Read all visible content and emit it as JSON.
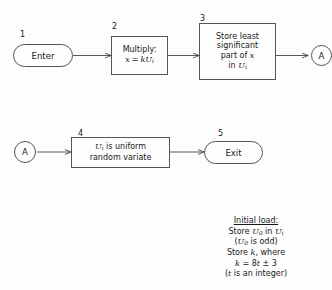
{
  "diagram": {
    "type": "flowchart",
    "title_note": "Initial load",
    "nodes": [
      {
        "id": "n1",
        "step": "1",
        "shape": "terminal",
        "label": "Enter"
      },
      {
        "id": "n2",
        "step": "2",
        "shape": "process",
        "line1": "Multiply:",
        "line2_lhs": "x",
        "line2_eq": "=",
        "line2_rhs_k": "k",
        "line2_rhs_u": "U",
        "line2_rhs_sub": "i"
      },
      {
        "id": "n3",
        "step": "3",
        "shape": "process",
        "line1": "Store least",
        "line2": "significant",
        "line3a": "part of",
        "line3b": "x",
        "line4a": "in",
        "line4b": "U",
        "line4sub": "i"
      },
      {
        "id": "cA_right",
        "shape": "connector",
        "label": "A"
      },
      {
        "id": "cA_left",
        "shape": "connector",
        "label": "A"
      },
      {
        "id": "n4",
        "step": "4",
        "shape": "process",
        "line1a": "U",
        "line1sub": "i",
        "line1b": "is uniform",
        "line2": "random variate"
      },
      {
        "id": "n5",
        "step": "5",
        "shape": "terminal",
        "label": "Exit"
      }
    ],
    "note": {
      "title": "Initial load:",
      "l1_a": "Store",
      "l1_u0": "U",
      "l1_u0sub": "0",
      "l1_b": "in",
      "l1_ui": "U",
      "l1_uisub": "i",
      "l2_open": "(",
      "l2_u0": "U",
      "l2_u0sub": "0",
      "l2_rest": "is odd)",
      "l3_a": "Store",
      "l3_k": "k",
      "l3_b": ", where",
      "l4_k": "k",
      "l4_eq": "= 8",
      "l4_t": "t",
      "l4_pm": "± 3",
      "l5_open": "(",
      "l5_t": "t",
      "l5_rest": "is an integer)"
    },
    "colors": {
      "stroke": "#555555",
      "text": "#1a1a1a",
      "background": "#fdfdfd"
    }
  }
}
